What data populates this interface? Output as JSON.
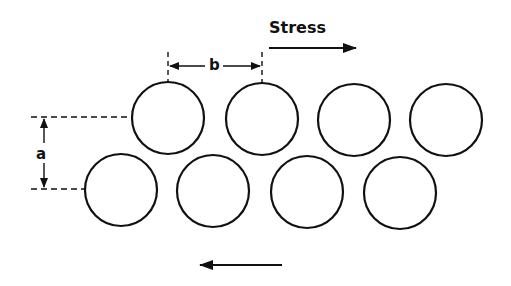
{
  "labels": {
    "stress": "Stress",
    "spacing_b": "b",
    "spacing_a": "a"
  },
  "colors": {
    "stroke": "#111111",
    "background": "#ffffff"
  },
  "circles": {
    "radius": 36,
    "top_row": [
      {
        "cx": 168,
        "cy": 118
      },
      {
        "cx": 262,
        "cy": 119
      },
      {
        "cx": 354,
        "cy": 120
      },
      {
        "cx": 446,
        "cy": 120
      }
    ],
    "bottom_row": [
      {
        "cx": 121,
        "cy": 190
      },
      {
        "cx": 213,
        "cy": 191
      },
      {
        "cx": 307,
        "cy": 192
      },
      {
        "cx": 400,
        "cy": 193
      }
    ]
  },
  "arrows": {
    "stress_top": {
      "direction": "right",
      "x1": 269,
      "x2": 356,
      "y": 48
    },
    "stress_bottom": {
      "direction": "left",
      "x1": 282,
      "x2": 200,
      "y": 265
    }
  }
}
